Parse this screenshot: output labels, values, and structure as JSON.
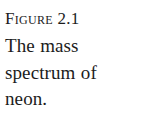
{
  "figure": {
    "label_prefix": "F",
    "label_rest": "igure",
    "label_number": "2.1",
    "label_full": "FIGURE 2.1",
    "caption_lines": [
      "The mass",
      "spectrum of",
      "neon."
    ],
    "caption_full": "The mass spectrum of neon.",
    "text_color": "#1c1c1c",
    "background_color": "#ffffff"
  }
}
